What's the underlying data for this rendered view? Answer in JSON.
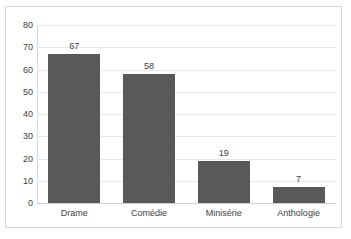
{
  "chart_data": {
    "type": "bar",
    "title": "",
    "subtitle": "",
    "xlabel": "",
    "ylabel": "",
    "categories": [
      "Drame",
      "Comédie",
      "Minisérie",
      "Anthologie"
    ],
    "values": [
      67,
      58,
      19,
      7
    ],
    "data_labels": [
      "67",
      "58",
      "19",
      "7"
    ],
    "ylim": [
      0,
      80
    ],
    "ytick_step": 10,
    "ytick_labels": [
      "80",
      "70",
      "60",
      "50",
      "40",
      "30",
      "20",
      "10",
      "0"
    ],
    "ytick_values": [
      80,
      70,
      60,
      50,
      40,
      30,
      20,
      10,
      0
    ],
    "grid": true,
    "grid_orientation": "horizontal",
    "legend": false,
    "legend_position": "none",
    "series": [
      {
        "name": "",
        "values": [
          67,
          58,
          19,
          7
        ]
      }
    ],
    "colors": {
      "bar": "#595959",
      "text": "#404040",
      "gridline": "#e8e8e8",
      "axis": "#d9d9d9",
      "border": "#d9d9d9",
      "background": "#ffffff"
    }
  }
}
